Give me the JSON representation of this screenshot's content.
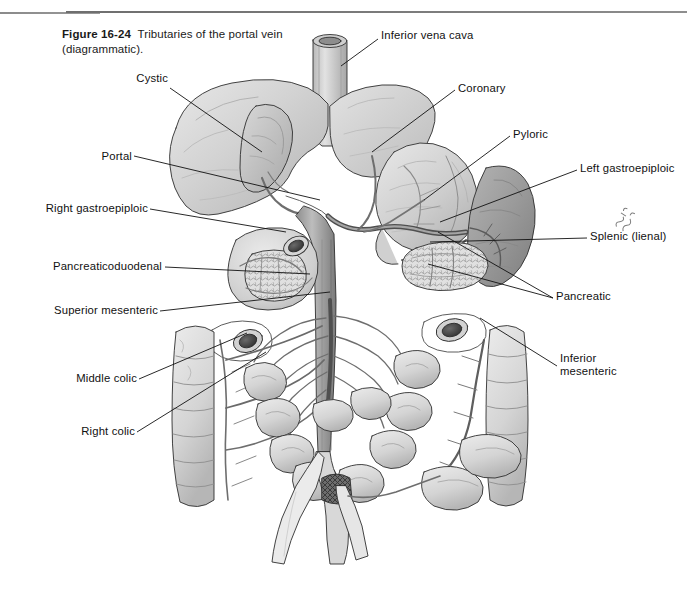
{
  "page": {
    "background_color": "#ffffff",
    "width": 687,
    "height": 600
  },
  "rules": {
    "short_rule": "horizontal-rule-short",
    "long_rule": "horizontal-rule-long"
  },
  "caption": {
    "figure_number": "Figure 16-24",
    "text": "Tributaries of the portal vein (diagrammatic)."
  },
  "illustration": {
    "title": "Tributaries of the portal vein",
    "style": "grayscale pen-and-ink medical illustration",
    "signature": "artist-signature",
    "colors": {
      "outline": "#2b2b2b",
      "vessel_fill": "#8f8f8f",
      "vessel_dark": "#5f5f5f",
      "organ_light": "#e4e4e4",
      "organ_mid": "#c6c6c6",
      "organ_dark": "#a0a0a0",
      "spleen": "#9b9b9b",
      "liver": "#cfcfcf",
      "stomach": "#d6d6d6",
      "lumen_dark": "#3a3a3a"
    },
    "structures": [
      "inferior vena cava",
      "liver",
      "gallbladder",
      "stomach",
      "spleen",
      "pancreas",
      "duodenum",
      "small intestine",
      "ascending colon",
      "transverse colon",
      "descending colon",
      "sigmoid colon",
      "rectum",
      "portal vein",
      "iliac veins"
    ]
  },
  "labels": [
    {
      "id": "inferior-vena-cava",
      "text": "Inferior vena cava",
      "side": "right",
      "x": 381,
      "y": 29,
      "leader": [
        [
          378,
          39
        ],
        [
          341,
          66
        ]
      ]
    },
    {
      "id": "cystic",
      "text": "Cystic",
      "side": "left",
      "x": 124,
      "y": 78,
      "leader": [
        [
          170,
          88
        ],
        [
          262,
          152
        ]
      ]
    },
    {
      "id": "coronary",
      "text": "Coronary",
      "side": "right",
      "x": 458,
      "y": 80,
      "leader": [
        [
          455,
          90
        ],
        [
          372,
          152
        ]
      ]
    },
    {
      "id": "portal",
      "text": "Portal",
      "side": "left",
      "x": 97,
      "y": 147,
      "leader": [
        [
          134,
          156
        ],
        [
          320,
          200
        ]
      ]
    },
    {
      "id": "pyloric",
      "text": "Pyloric",
      "side": "right",
      "x": 513,
      "y": 126,
      "leader": [
        [
          510,
          136
        ],
        [
          424,
          200
        ]
      ]
    },
    {
      "id": "left-gastroepiploic",
      "text": "Left gastroepiploic",
      "side": "right",
      "x": 580,
      "y": 160,
      "leader": [
        [
          577,
          170
        ],
        [
          440,
          222
        ]
      ]
    },
    {
      "id": "right-gastroepiploic",
      "text": "Right gastroepiploic",
      "side": "left",
      "x": 24,
      "y": 200,
      "leader": [
        [
          150,
          209
        ],
        [
          286,
          232
        ]
      ]
    },
    {
      "id": "splenic-lienal",
      "text": "Splenic (lienal)",
      "side": "right",
      "x": 590,
      "y": 228,
      "leader": [
        [
          587,
          238
        ],
        [
          430,
          242
        ]
      ]
    },
    {
      "id": "pancreaticoduodenal",
      "text": "Pancreaticoduodenal",
      "side": "left",
      "x": 38,
      "y": 258,
      "leader": [
        [
          165,
          267
        ],
        [
          310,
          274
        ]
      ]
    },
    {
      "id": "pancreatic",
      "text": "Pancreatic",
      "side": "right",
      "x": 556,
      "y": 288,
      "leader": [
        [
          553,
          298
        ],
        [
          438,
          230
        ]
      ]
    },
    {
      "id": "pancreatic-second",
      "text": "",
      "side": "right",
      "x": 556,
      "y": 288,
      "leader": [
        [
          553,
          298
        ],
        [
          430,
          262
        ]
      ]
    },
    {
      "id": "superior-mesenteric",
      "text": "Superior mesenteric",
      "side": "left",
      "x": 45,
      "y": 302,
      "leader": [
        [
          160,
          311
        ],
        [
          330,
          290
        ]
      ]
    },
    {
      "id": "inferior-mesenteric",
      "text": "Inferior\nmesenteric",
      "side": "right",
      "x": 560,
      "y": 355,
      "leader": [
        [
          557,
          366
        ],
        [
          480,
          318
        ]
      ]
    },
    {
      "id": "middle-colic",
      "text": "Middle colic",
      "side": "left",
      "x": 71,
      "y": 370,
      "leader": [
        [
          139,
          379
        ],
        [
          247,
          333
        ]
      ]
    },
    {
      "id": "right-colic",
      "text": "Right colic",
      "side": "left",
      "x": 78,
      "y": 423,
      "leader": [
        [
          137,
          432
        ],
        [
          265,
          352
        ]
      ]
    }
  ]
}
